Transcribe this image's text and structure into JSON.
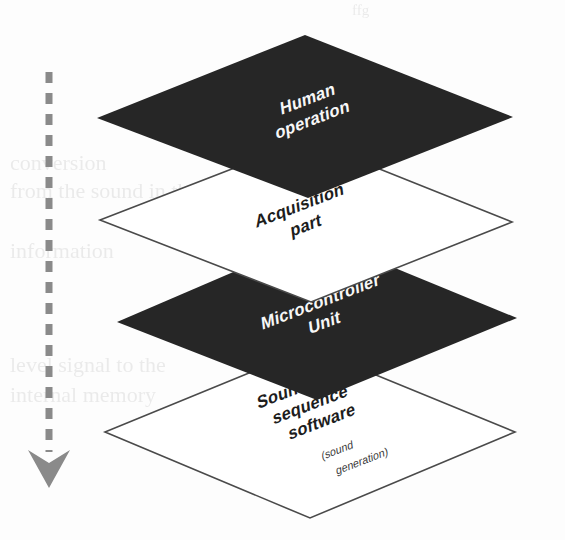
{
  "diagram": {
    "orientation": "isometric exploded stack, top to bottom",
    "background_color": "#fdfdfd",
    "colors": {
      "dark_layer": "#262626",
      "open_layer_fill": "#ffffff",
      "open_layer_stroke": "#4a4a4a",
      "highlight_patch": "#d2d2d2",
      "arrow": "#8a8a8a",
      "light_text": "#f7f7f7",
      "dark_text": "#1d1d1d"
    },
    "layers": [
      {
        "id": "human-operation",
        "label": "Human",
        "label_line2": "operation",
        "style": "dark-filled",
        "order": 1
      },
      {
        "id": "acquisition-part",
        "label": "Acquisition",
        "label_line2": "part",
        "style": "outlined",
        "order": 2
      },
      {
        "id": "microcontroller-unit",
        "label": "Microcontroller",
        "label_line2": "Unit",
        "style": "dark-filled",
        "order": 3
      },
      {
        "id": "sound-sequence-software",
        "label": "Sound",
        "label_line2": "sequence",
        "label_line3": "software",
        "sublabel_line1": "(sound",
        "sublabel_line2": "generation)",
        "style": "outlined",
        "order": 4
      }
    ],
    "flow_arrow": {
      "id": "downward-flow-arrow",
      "style": "dashed",
      "direction": "down",
      "label": ""
    },
    "highlight": {
      "id": "interface-patch",
      "description": "light gray connecting patch between acquisition and microcontroller layers"
    }
  },
  "background_text": {
    "fragments": [
      "ffg",
      "conversion",
      "from  the  sound  in  the",
      "data",
      "information",
      "level  signal  to  the",
      "internal  memory"
    ]
  }
}
